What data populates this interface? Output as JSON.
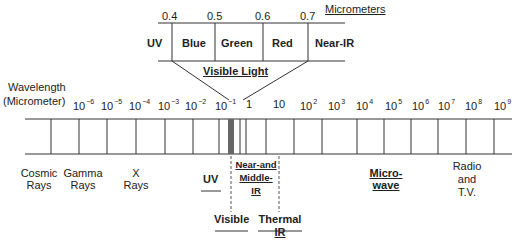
{
  "visible_inset": {
    "unit_label": "Micrometers",
    "boundaries": [
      "0.4",
      "0.5",
      "0.6",
      "0.7"
    ],
    "bands": [
      "UV",
      "Blue",
      "Green",
      "Red",
      "Near-IR"
    ],
    "title": "Visible Light"
  },
  "axis": {
    "label_line1": "Wavelength",
    "label_line2": "(Micrometer)",
    "ticks": [
      {
        "base": "10",
        "exp": "−6"
      },
      {
        "base": "10",
        "exp": "−5"
      },
      {
        "base": "10",
        "exp": "−4"
      },
      {
        "base": "10",
        "exp": "−3"
      },
      {
        "base": "10",
        "exp": "−2"
      },
      {
        "base": "10",
        "exp": "−1"
      },
      {
        "base": "1",
        "exp": ""
      },
      {
        "base": "10",
        "exp": ""
      },
      {
        "base": "10",
        "exp": "2"
      },
      {
        "base": "10",
        "exp": "3"
      },
      {
        "base": "10",
        "exp": "4"
      },
      {
        "base": "10",
        "exp": "5"
      },
      {
        "base": "10",
        "exp": "6"
      },
      {
        "base": "10",
        "exp": "7"
      },
      {
        "base": "10",
        "exp": "8"
      },
      {
        "base": "10",
        "exp": "9"
      }
    ]
  },
  "regions": {
    "cosmic": {
      "l1": "Cosmic",
      "l2": "Rays"
    },
    "gamma": {
      "l1": "Gamma",
      "l2": "Rays"
    },
    "xray": {
      "l1": "X",
      "l2": "Rays"
    },
    "uv": "UV",
    "near_mid_ir": {
      "l1": "Near-and",
      "l2": "Middle-",
      "l3": "IR"
    },
    "microwave": {
      "l1": "Micro-",
      "l2": "wave"
    },
    "radio": {
      "l1": "Radio",
      "l2": "and",
      "l3": "T.V."
    },
    "visible": "Visible",
    "thermal_ir": {
      "l1": "Thermal",
      "l2": "IR"
    }
  },
  "colors": {
    "line": "#333333",
    "visible_band": "#666666"
  }
}
